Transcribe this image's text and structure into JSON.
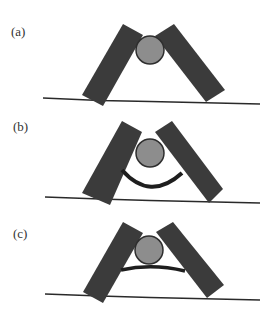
{
  "figure": {
    "panels": [
      {
        "label": "(a)",
        "label_pos": [
          11,
          25
        ],
        "left_bar": [
          [
            123,
            24
          ],
          [
            143,
            35
          ],
          [
            103,
            106
          ],
          [
            82,
            95
          ]
        ],
        "right_bar": [
          [
            155,
            36
          ],
          [
            174,
            24
          ],
          [
            225,
            90
          ],
          [
            206,
            102
          ]
        ],
        "circle": {
          "cx": 150,
          "cy": 50,
          "r": 14
        },
        "ground": {
          "x1": 43,
          "y1": 98,
          "x2": 260,
          "y2": 104
        },
        "element": "none"
      },
      {
        "label": "(b)",
        "label_pos": [
          13,
          120
        ],
        "left_bar": [
          [
            122,
            121
          ],
          [
            142,
            132
          ],
          [
            110,
            205
          ],
          [
            82,
            193
          ]
        ],
        "right_bar": [
          [
            155,
            132
          ],
          [
            172,
            121
          ],
          [
            223,
            189
          ],
          [
            209,
            203
          ]
        ],
        "circle": {
          "cx": 150,
          "cy": 153,
          "r": 14
        },
        "ground": {
          "x1": 45,
          "y1": 197,
          "x2": 260,
          "y2": 203
        },
        "element": "arc",
        "arc_path": "M122,170 Q150,202 182,173"
      },
      {
        "label": "(c)",
        "label_pos": [
          13,
          227
        ],
        "left_bar": [
          [
            123,
            222
          ],
          [
            143,
            233
          ],
          [
            103,
            303
          ],
          [
            83,
            292
          ]
        ],
        "right_bar": [
          [
            156,
            232
          ],
          [
            173,
            222
          ],
          [
            224,
            285
          ],
          [
            207,
            298
          ]
        ],
        "circle": {
          "cx": 149,
          "cy": 250,
          "r": 14
        },
        "ground": {
          "x1": 45,
          "y1": 294,
          "x2": 260,
          "y2": 300
        },
        "element": "rod",
        "rod_path": "M121,270 Q152,263 185,271"
      }
    ],
    "colors": {
      "bar": "#3b3b3b",
      "ball": "#8d8d8d",
      "ball_stroke": "#2e2e2e",
      "ground": "#2a2a2a",
      "connector": "#1e1e1e"
    }
  }
}
